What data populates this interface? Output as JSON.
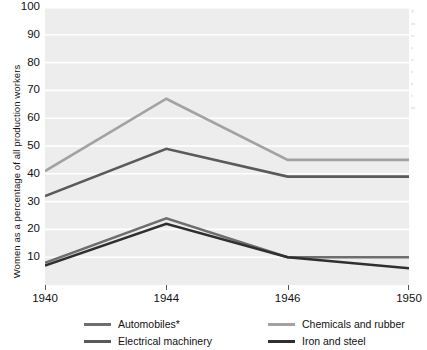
{
  "chart_data": {
    "type": "line",
    "title": "",
    "xlabel": "",
    "ylabel": "Women as a percentage of all production workers",
    "x": [
      1940,
      1944,
      1946,
      1950
    ],
    "xticklabels": [
      "1940",
      "1944",
      "1946",
      "1950"
    ],
    "yticklabels": [
      "10",
      "20",
      "30",
      "40",
      "50",
      "60",
      "70",
      "80",
      "90",
      "100"
    ],
    "ylim": [
      0,
      100
    ],
    "ytick_step": 10,
    "grid": "horizontal-white",
    "legend_position": "below-plot",
    "plot_background": "#ededee",
    "series": [
      {
        "name": "Automobiles*",
        "color": "#6e6e6e",
        "values": [
          8,
          24,
          10,
          10
        ]
      },
      {
        "name": "Chemicals and rubber",
        "color": "#a2a2a2",
        "values": [
          41,
          67,
          45,
          45
        ]
      },
      {
        "name": "Electrical machinery",
        "color": "#5a5a5a",
        "values": [
          32,
          49,
          39,
          39
        ]
      },
      {
        "name": "Iron and steel",
        "color": "#2f2f2f",
        "values": [
          7,
          22,
          10,
          6
        ]
      }
    ]
  },
  "legend": {
    "items": [
      {
        "label": "Automobiles*",
        "color": "#6e6e6e"
      },
      {
        "label": "Chemicals and rubber",
        "color": "#a2a2a2"
      },
      {
        "label": "Electrical machinery",
        "color": "#5a5a5a"
      },
      {
        "label": "Iron and steel",
        "color": "#2f2f2f"
      }
    ]
  },
  "edge_text": {
    "lines": [
      "T",
      "in",
      "w",
      "s",
      "o",
      "c",
      "a",
      "f",
      "in"
    ]
  }
}
